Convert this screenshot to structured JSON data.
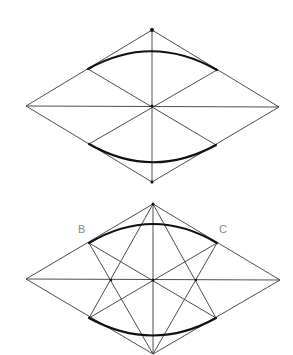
{
  "figure": {
    "width": 293,
    "height": 355,
    "background": "#ffffff",
    "line_color": "#3a3a3a",
    "arc_color": "#111111",
    "label_color": "#8a8a8a"
  },
  "diagrams": [
    {
      "name": "rhombus-construction-step-1",
      "vertices": {
        "top": [
          152,
          30
        ],
        "right": [
          279,
          107
        ],
        "bottom": [
          152,
          182
        ],
        "left": [
          26,
          106
        ]
      },
      "center": [
        152,
        106
      ],
      "arc_endpoints": {
        "top_left": [
          88,
          69
        ],
        "top_right": [
          217,
          70
        ],
        "bottom_left": [
          89,
          144
        ],
        "bottom_right": [
          216,
          145
        ]
      },
      "arc_apex": {
        "top": [
          152,
          51
        ],
        "bottom": [
          152,
          162
        ]
      }
    },
    {
      "name": "rhombus-construction-step-2",
      "vertices": {
        "top": [
          153,
          204
        ],
        "right": [
          280,
          280
        ],
        "bottom": [
          153,
          354
        ],
        "left": [
          26,
          279
        ]
      },
      "center": [
        153,
        280
      ],
      "arc_endpoints": {
        "top_left": [
          89,
          243
        ],
        "top_right": [
          217,
          243
        ],
        "bottom_left": [
          89,
          318
        ],
        "bottom_right": [
          216,
          318
        ]
      },
      "arc_apex": {
        "top": [
          153,
          224
        ],
        "bottom": [
          153,
          335
        ]
      },
      "inner_points": {
        "left": [
          111,
          280
        ],
        "right": [
          196,
          280
        ]
      },
      "labels": {
        "B": "B",
        "C": "C"
      }
    }
  ]
}
